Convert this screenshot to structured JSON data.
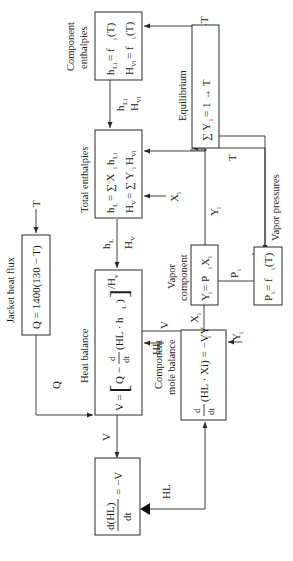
{
  "diagram": {
    "type": "block-flow-diagram",
    "orientation": "rotated-90-ccw",
    "blocks": [
      {
        "id": "component_enthalpies",
        "title": "Component enthalpies",
        "title_line1": "Component",
        "title_line2": "enthalpies",
        "eq1": "h",
        "eq1_sub": "Li",
        "eq1_rhs": " = f",
        "eq1_rhs_sub": "i",
        "eq1_tail": "(T)",
        "eq2": "H",
        "eq2_sub": "Vi",
        "eq2_rhs": " = f",
        "eq2_rhs_sub": "i",
        "eq2_tail": "(T)"
      },
      {
        "id": "total_enthalpies",
        "title": "Total enthalpies",
        "eq1": "h",
        "eq1_sub": "L",
        "eq1_rhs": " = ∑ X",
        "eq1_rhs_sub": "i",
        "eq1_tail": "h",
        "eq1_tail_sub": "Li",
        "eq2": "H",
        "eq2_sub": "V",
        "eq2_rhs": " = ∑ Y",
        "eq2_rhs_sub": "i",
        "eq2_tail": "H",
        "eq2_tail_sub": "Vi"
      },
      {
        "id": "jacket_heat_flux",
        "title": "Jacket heat flux",
        "eq": "Q = 1400(130 − T)"
      },
      {
        "id": "heat_balance",
        "title": "Heat balance",
        "eq_lhs": "V = ",
        "eq_q": "Q − ",
        "eq_d": "d",
        "eq_dt": "dt",
        "eq_body": "(HL · h",
        "eq_body_sub": "L",
        "eq_close": ")",
        "eq_div": "/H",
        "eq_div_sub": "v"
      },
      {
        "id": "equilibrium",
        "title": "Equilibrium",
        "eq": "∑ Y",
        "eq_sub": "i",
        "eq_tail": " = 1 → T"
      },
      {
        "id": "vapor_component",
        "title_line1": "Vapor",
        "title_line2": "component",
        "eq": "Y",
        "eq_sub": "i",
        "eq_mid": " = P",
        "eq_mid_sub": "i",
        "eq_tail": "X",
        "eq_tail_sub": "i"
      },
      {
        "id": "vapor_pressures",
        "title": "Vapor pressures",
        "eq": "P",
        "eq_sub": "i",
        "eq_mid": " = f",
        "eq_mid_sub": "i",
        "eq_tail": "(T)"
      },
      {
        "id": "component_mole_balance",
        "title_line1": "Component",
        "title_line2": "mole balance",
        "eq_d": "d",
        "eq_dt": "dt",
        "eq_body": "(HL · Xi) = −VY",
        "eq_body_sub": "i"
      },
      {
        "id": "total_mass_balance",
        "eq_num": "d(HL)",
        "eq_den": "dt",
        "eq_rhs": "= −V"
      }
    ],
    "signals": {
      "T_in_jacket": "T",
      "T_to_enthalpies": "T",
      "T_to_vapor_pressures": "T",
      "Q": "Q",
      "hLi": "h",
      "hLi_sub": "Li",
      "HVi": "H",
      "HVi_sub": "Vi",
      "hL": "h",
      "hL_sub": "L",
      "HV": "H",
      "HV_sub": "V",
      "Xi_to_total": "X",
      "Xi_sub": "i",
      "Yi_up": "Y",
      "Yi_sub": "i",
      "Pi": "P",
      "Pi_sub": "i",
      "HL_to_heat": "HL",
      "V_between": "V",
      "Xi_mid": "X",
      "Yi_mole": "Y",
      "V_down": "V",
      "HL_out": "HL"
    }
  }
}
